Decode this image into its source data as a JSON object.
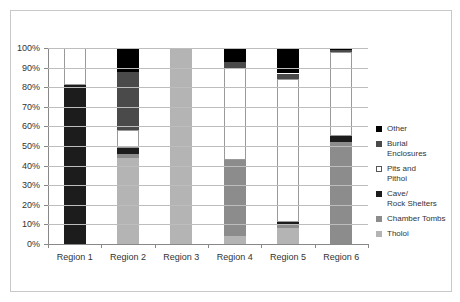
{
  "chart_data": {
    "type": "bar",
    "stacked": true,
    "percent_stacked": true,
    "title": "",
    "xlabel": "",
    "ylabel": "",
    "ylim": [
      0,
      100
    ],
    "y_ticks": [
      "0%",
      "10%",
      "20%",
      "30%",
      "40%",
      "50%",
      "60%",
      "70%",
      "80%",
      "90%",
      "100%"
    ],
    "grid": true,
    "legend_position": "right",
    "categories": [
      "Region 1",
      "Region 2",
      "Region 3",
      "Region 4",
      "Region 5",
      "Region 6"
    ],
    "series": [
      {
        "name": "Tholoi",
        "color": "#b4b4b4",
        "values": [
          0,
          44,
          100,
          4,
          8,
          0
        ]
      },
      {
        "name": "Chamber Tombs",
        "color": "#8c8c8c",
        "values": [
          0,
          2,
          0,
          39,
          2,
          52
        ]
      },
      {
        "name": "Cave/\nRock Shelters",
        "color": "#1c1c1c",
        "values": [
          81,
          3,
          0,
          0,
          1,
          3
        ]
      },
      {
        "name": "Pits and\nPithoi",
        "color": "#ffffff",
        "values": [
          19,
          9,
          0,
          47,
          73,
          43
        ]
      },
      {
        "name": "Burial\nEnclosures",
        "color": "#4a4a4a",
        "values": [
          0,
          30,
          0,
          3,
          3,
          1
        ]
      },
      {
        "name": "Other",
        "color": "#000000",
        "values": [
          0,
          12,
          0,
          7,
          13,
          1
        ]
      }
    ]
  },
  "legend": {
    "items": [
      {
        "label": "Other",
        "color": "#000000"
      },
      {
        "label": "Burial\nEnclosures",
        "color": "#4a4a4a"
      },
      {
        "label": "Pits and\nPithoi",
        "color": "#ffffff"
      },
      {
        "label": "Cave/\nRock Shelters",
        "color": "#1c1c1c"
      },
      {
        "label": "Chamber Tombs",
        "color": "#8c8c8c"
      },
      {
        "label": "Tholoi",
        "color": "#b4b4b4"
      }
    ]
  }
}
